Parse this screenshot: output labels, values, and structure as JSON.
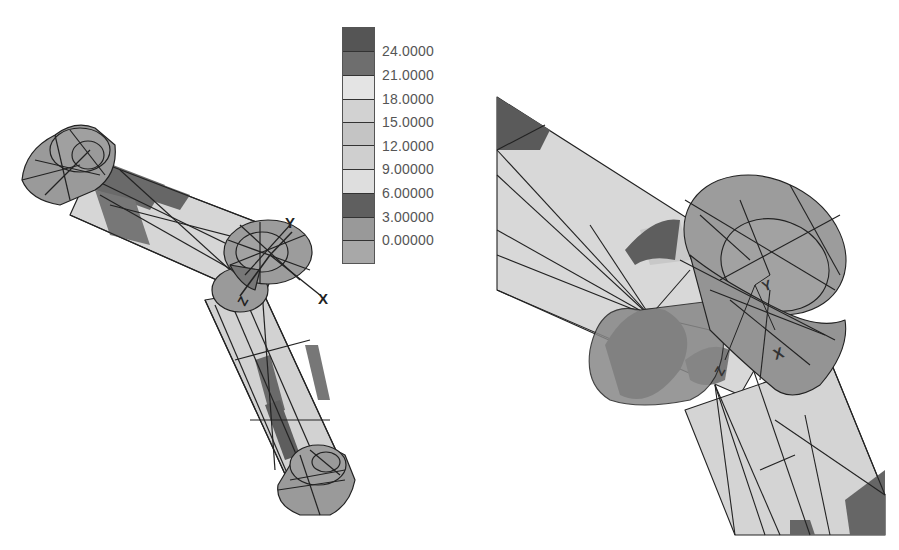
{
  "figure": {
    "type": "fea-contour-plot",
    "views": [
      {
        "name": "full-assembly",
        "description": "Bent two-arm connector with end cylinders and central joint"
      },
      {
        "name": "joint-closeup",
        "description": "Close-up of central joint showing mesh and axes"
      }
    ],
    "axes_labels": {
      "x": "X",
      "y": "Y",
      "z": "Z"
    }
  },
  "legend": {
    "bands": [
      {
        "color": "#555555"
      },
      {
        "color": "#6e6e6e"
      },
      {
        "color": "#e4e4e4"
      },
      {
        "color": "#d2d2d2"
      },
      {
        "color": "#c4c4c4"
      },
      {
        "color": "#cfcfcf"
      },
      {
        "color": "#dedede"
      },
      {
        "color": "#5f5f5f"
      },
      {
        "color": "#999999"
      },
      {
        "color": "#a8a8a8"
      }
    ],
    "labels": [
      "24.0000",
      "21.0000",
      "18.0000",
      "15.0000",
      "12.0000",
      "9.00000",
      "6.00000",
      "3.00000",
      "0.00000"
    ]
  },
  "colors": {
    "background": "#ffffff",
    "mesh_line": "#222222",
    "light_fill": "#d6d6d6",
    "mid_fill": "#9c9c9c",
    "dark_fill": "#666666",
    "darkest_fill": "#555555"
  }
}
